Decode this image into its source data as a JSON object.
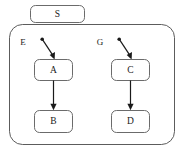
{
  "diagram": {
    "colors": {
      "background": "#ffffff",
      "box_stroke": "#5a5a5a",
      "container_stroke": "#4a4a4a",
      "edge": "#1a1a1a",
      "text": "#1a1a1a"
    },
    "container": {
      "label": "",
      "x": 9,
      "y": 24,
      "width": 166,
      "height": 121,
      "corner_radius": 13
    },
    "nodes": [
      {
        "id": "S",
        "label": "S",
        "x": 30,
        "y": 5,
        "width": 55,
        "height": 18,
        "corner_radius": 5
      },
      {
        "id": "A",
        "label": "A",
        "x": 34,
        "y": 59,
        "width": 39,
        "height": 22,
        "corner_radius": 5
      },
      {
        "id": "B",
        "label": "B",
        "x": 34,
        "y": 110,
        "width": 39,
        "height": 23,
        "corner_radius": 5
      },
      {
        "id": "C",
        "label": "C",
        "x": 111,
        "y": 59,
        "width": 39,
        "height": 22,
        "corner_radius": 5
      },
      {
        "id": "D",
        "label": "D",
        "x": 111,
        "y": 110,
        "width": 39,
        "height": 23,
        "corner_radius": 5
      }
    ],
    "port_labels": [
      {
        "id": "E",
        "label": "E",
        "x": 23,
        "y": 43
      },
      {
        "id": "G",
        "label": "G",
        "x": 100,
        "y": 43
      }
    ],
    "edges": [
      {
        "id": "E-to-A",
        "from": "E",
        "to": "A",
        "type": "entry",
        "x1": 42,
        "y1": 39,
        "x2": 54,
        "y2": 58
      },
      {
        "id": "A-to-B",
        "from": "A",
        "to": "B",
        "type": "transition",
        "x1": 53,
        "y1": 81,
        "x2": 53,
        "y2": 109
      },
      {
        "id": "G-to-C",
        "from": "G",
        "to": "C",
        "type": "entry",
        "x1": 119,
        "y1": 39,
        "x2": 131,
        "y2": 58
      },
      {
        "id": "C-to-D",
        "from": "C",
        "to": "D",
        "type": "transition",
        "x1": 130,
        "y1": 81,
        "x2": 130,
        "y2": 109
      }
    ]
  }
}
